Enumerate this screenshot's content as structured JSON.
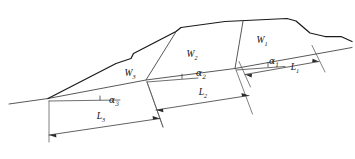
{
  "figure": {
    "type": "engineering-cross-section",
    "background_color": "#ffffff",
    "line_color": "#1a1a1a",
    "thin_line_color": "#3a3a3a"
  },
  "blocks": [
    {
      "id": "w1",
      "symbol": "W",
      "subscript": "1",
      "x": 268,
      "y": 40
    },
    {
      "id": "w2",
      "symbol": "W",
      "subscript": "2",
      "x": 193,
      "y": 55
    },
    {
      "id": "w3",
      "symbol": "W",
      "subscript": "3",
      "x": 131,
      "y": 73
    }
  ],
  "angles": [
    {
      "id": "alpha1",
      "symbol": "α",
      "subscript": "1",
      "x": 272,
      "y": 64
    },
    {
      "id": "alpha2",
      "symbol": "α",
      "subscript": "2",
      "x": 198,
      "y": 89
    },
    {
      "id": "alpha3",
      "symbol": "α",
      "subscript": "3",
      "x": 110,
      "y": 106
    }
  ],
  "lengths": [
    {
      "id": "l1",
      "symbol": "L",
      "subscript": "1",
      "x": 298,
      "y": 70
    },
    {
      "id": "l2",
      "symbol": "L",
      "subscript": "2",
      "x": 203,
      "y": 101
    },
    {
      "id": "l3",
      "symbol": "L",
      "subscript": "3",
      "x": 84,
      "y": 122
    }
  ],
  "geometry": {
    "ground_profile_points": "10,104 48,98 146,79 235,68 330,51 352,48",
    "crest_profile_points": "48,98 118,62 131,57 133,53 176,31 181,27 225,22 287,19 296,21 310,33 324,37 341,37 352,42",
    "slip_surface_points": "48,98 146,79 235,68 330,51",
    "divider_w3_w2": "146,79 176,31",
    "divider_w2_w1": "235,68 243,21",
    "reference_line_alpha1": "236,70 283,67",
    "reference_line_alpha2": "147,81 196,77",
    "reference_line_alpha3": "49,100 118,99",
    "dim_l1_line": "252,82 318,70",
    "dim_l2_line": "55,135 268,101",
    "dim_l3_line": "55,135 160,119"
  },
  "labels_rendered": [
    "W1",
    "W2",
    "W3",
    "α1",
    "α2",
    "α3",
    "L1",
    "L2",
    "L3"
  ]
}
